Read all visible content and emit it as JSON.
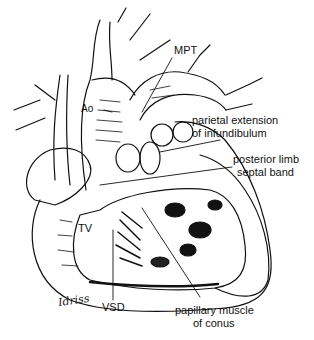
{
  "figure": {
    "labels": {
      "mpt": "MPT",
      "ao": "Ao",
      "parietal_1": "parietal extension",
      "parietal_2": "of infundibulum",
      "posterior_1": "posterior limb",
      "posterior_2": "septal band",
      "tv": "TV",
      "vsd": "VSD",
      "papillary_1": "papillary muscle",
      "papillary_2": "of conus"
    },
    "signature": "Idriss"
  },
  "colors": {
    "ink": "#111111",
    "paper": "#ffffff",
    "shade": "#1a1a1a"
  }
}
